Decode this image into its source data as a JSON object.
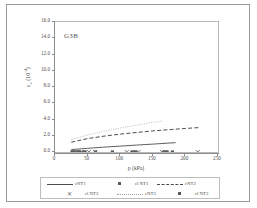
{
  "figure": {
    "annotation": "G3B"
  },
  "axes": {
    "y": {
      "title": "εv (10-4)",
      "ticks": [
        "16.0",
        "14.0",
        "12.0",
        "10.0",
        "8.0",
        "6.0",
        "4.0",
        "2.0",
        "0.0"
      ],
      "min": 0,
      "max": 16
    },
    "x": {
      "title": "p (kPa)",
      "ticks": [
        "0",
        "50",
        "100",
        "150",
        "200",
        "250"
      ],
      "min": 0,
      "max": 250
    }
  },
  "legend": {
    "row1": [
      {
        "label": "εNT1",
        "marker": "solid-line"
      },
      {
        "label": "εl NT1",
        "marker": "filled-square"
      },
      {
        "label": "εNT2",
        "marker": "dashed-line"
      }
    ],
    "row2": [
      {
        "label": "εl NT2",
        "marker": "cross"
      },
      {
        "label": "εNT3",
        "marker": "dotted-line"
      },
      {
        "label": "εl NT3",
        "marker": "filled-square"
      }
    ]
  },
  "colors": {
    "line_dark": "#4d4d4d",
    "line_light": "#9b9b9b",
    "marker": "#5a5a5a",
    "axis": "#8c8c8c",
    "frame": "#9a9a9a"
  },
  "chart_data": {
    "type": "line",
    "title": "",
    "subtitle": "",
    "annotation": "G3B",
    "xlabel": "p (kPa)",
    "ylabel": "εv (10-4)",
    "xlim": [
      0,
      250
    ],
    "ylim": [
      0,
      16
    ],
    "xticks": [
      0,
      50,
      100,
      150,
      200,
      250
    ],
    "yticks": [
      0,
      2,
      4,
      6,
      8,
      10,
      12,
      14,
      16
    ],
    "grid": false,
    "legend_position": "bottom",
    "series": [
      {
        "name": "εNT1",
        "style": "solid-line",
        "color": "#4d4d4d",
        "x": [
          25,
          50,
          75,
          100,
          125,
          150,
          175,
          185
        ],
        "y": [
          0.3,
          0.45,
          0.6,
          0.72,
          0.85,
          0.97,
          1.1,
          1.15
        ]
      },
      {
        "name": "εl NT1",
        "style": "filled-square",
        "color": "#5a5a5a",
        "x": [
          26,
          30,
          34,
          38,
          44,
          62,
          88,
          118,
          124,
          167,
          172,
          180
        ],
        "y": [
          0,
          0,
          0,
          0,
          0,
          0,
          0,
          0,
          0,
          0,
          0,
          0
        ]
      },
      {
        "name": "εNT2",
        "style": "dashed-line",
        "color": "#4d4d4d",
        "x": [
          25,
          50,
          75,
          100,
          125,
          150,
          175,
          200,
          220
        ],
        "y": [
          1.2,
          1.65,
          1.95,
          2.2,
          2.4,
          2.6,
          2.75,
          2.9,
          3.0
        ]
      },
      {
        "name": "εl NT2",
        "style": "cross",
        "color": "#6a6a6a",
        "x": [
          33,
          41,
          52,
          62,
          110,
          128,
          164,
          219
        ],
        "y": [
          0,
          0,
          0,
          0,
          0,
          0,
          0,
          0
        ]
      },
      {
        "name": "εNT3",
        "style": "dotted-line",
        "color": "#9b9b9b",
        "x": [
          25,
          50,
          75,
          100,
          125,
          150,
          165
        ],
        "y": [
          1.5,
          2.1,
          2.55,
          2.95,
          3.3,
          3.65,
          3.8
        ]
      },
      {
        "name": "εl NT3",
        "style": "filled-square",
        "color": "#5a5a5a",
        "x": [
          27,
          36,
          46,
          121,
          170
        ],
        "y": [
          0,
          0,
          0,
          0,
          0
        ]
      }
    ]
  }
}
